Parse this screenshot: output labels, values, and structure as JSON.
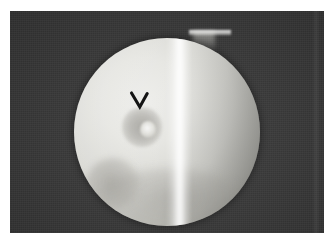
{
  "image": {
    "domain": "Natural-Image",
    "modality_label": "endoscopic-fluoroscopic-still",
    "width": 324,
    "height": 243,
    "caption": "",
    "background_color": "#3a3a3a",
    "page_color": "#ffffff"
  },
  "frame": {
    "name": "photographic-frame",
    "x": 10,
    "y": 11,
    "width": 314,
    "height": 222,
    "fill": "#3a3a3a"
  },
  "field_of_view": {
    "name": "circular-field-of-view",
    "center_x": 157,
    "center_y": 121,
    "radius": 93,
    "highlight_color": "#ededea",
    "midtone_color": "#d8d8d3",
    "shadow_color": "#8f8f89"
  },
  "features": [
    {
      "name": "pointer-arrow",
      "shape": "chevron-down",
      "color": "#151515",
      "x": 129,
      "y": 90,
      "width": 22,
      "height": 22,
      "label": ""
    },
    {
      "name": "lesion",
      "shape": "round-hypodense",
      "center_x": 132,
      "center_y": 116,
      "diameter": 40,
      "color": "#8c8a84"
    },
    {
      "name": "lesion-nidus",
      "shape": "bright-center",
      "center_x": 148,
      "center_y": 129,
      "diameter": 16,
      "color": "#ffffff"
    },
    {
      "name": "secondary-lesion",
      "shape": "faint-round-shadow",
      "center_x": 103,
      "center_y": 173,
      "diameter": 54,
      "color": "#76746e"
    },
    {
      "name": "bright-vertical-band",
      "shape": "specular-stripe",
      "x": 166,
      "width": 26,
      "color": "#ffffff"
    },
    {
      "name": "instrument-tip",
      "shape": "horizontal-flange",
      "x": 189,
      "y": 30,
      "width": 42,
      "height": 5,
      "color": "#ffffff"
    }
  ],
  "annotations": {
    "arrow_glyph": "V",
    "arrow_meaning": "points-to-lesion"
  }
}
